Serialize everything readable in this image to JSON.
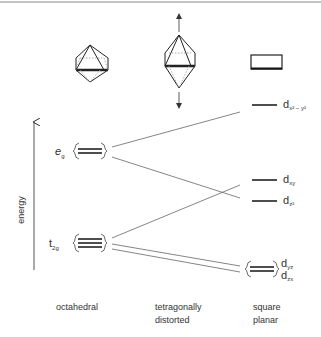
{
  "diagram": {
    "axis": {
      "label": "energy"
    },
    "columns": [
      {
        "id": "octahedral",
        "caption": [
          "octahedral"
        ]
      },
      {
        "id": "tetragonal",
        "caption": [
          "tetragonally",
          "distorted"
        ]
      },
      {
        "id": "square-planar",
        "caption": [
          "square",
          "planar"
        ]
      }
    ],
    "octahedral_levels": {
      "eg": {
        "label_main": "e",
        "label_sub": "g",
        "degeneracy": 2
      },
      "t2g": {
        "label_main": "t",
        "label_sub": "2g",
        "degeneracy": 3
      }
    },
    "square_planar_levels": [
      {
        "id": "dx2-y2",
        "label_main": "d",
        "label_sub": "x² − y²"
      },
      {
        "id": "dxy",
        "label_main": "d",
        "label_sub": "xy"
      },
      {
        "id": "dz2",
        "label_main": "d",
        "label_sub": "z²"
      },
      {
        "id": "dyz-dzx",
        "label_main": "d",
        "label_sub": [
          "yz",
          "zx"
        ],
        "degeneracy": 2
      }
    ],
    "correlations": [
      {
        "from": "eg",
        "to": "dx2-y2"
      },
      {
        "from": "eg",
        "to": "dz2"
      },
      {
        "from": "t2g",
        "to": "dxy"
      },
      {
        "from": "t2g",
        "to": "dyz-dzx"
      },
      {
        "from": "t2g",
        "to": "dyz-dzx"
      }
    ],
    "colors": {
      "ink": "#222222",
      "line": "#555555",
      "dash": "#999999"
    }
  }
}
